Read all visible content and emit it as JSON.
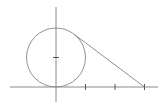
{
  "diagram": {
    "colors": {
      "lines": "#8f8f8f",
      "axes": "#8a8a8a",
      "ticks": "#555555",
      "background": "#ffffff"
    },
    "axes": {
      "x_range": [
        -1.6,
        3.5
      ],
      "y_range": [
        -0.5,
        2.7
      ],
      "x_ticks": [
        1,
        2,
        3
      ],
      "y_ticks": [
        1
      ],
      "tick_labels_shown": false
    },
    "circle": {
      "center": [
        0,
        1
      ],
      "radius": 1
    },
    "tangent_line": {
      "from": [
        3,
        0
      ],
      "to": [
        0.6,
        1.8
      ]
    }
  }
}
